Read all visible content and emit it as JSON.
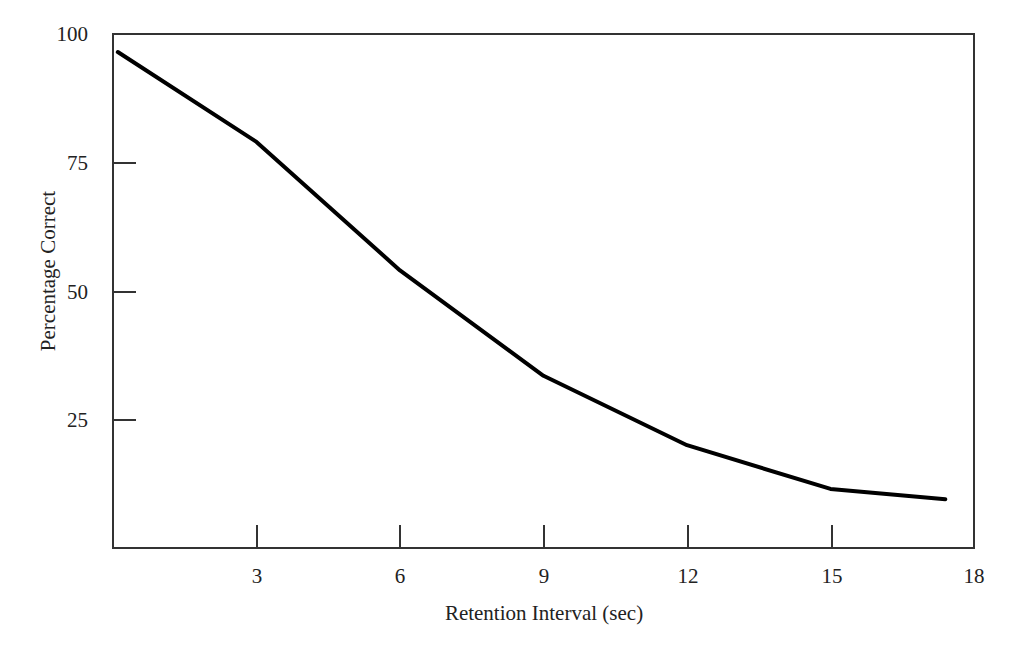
{
  "chart_data": {
    "type": "line",
    "title": "",
    "subtitle": "",
    "xlabel": "Retention Interval (sec)",
    "ylabel": "Percentage Correct",
    "xlim": [
      0,
      18
    ],
    "ylim": [
      0,
      100
    ],
    "xticks": [
      3,
      6,
      9,
      12,
      15,
      18
    ],
    "xtick_labels": [
      "3",
      "6",
      "9",
      "12",
      "15",
      "18"
    ],
    "yticks": [
      25,
      50,
      75,
      100
    ],
    "ytick_labels": [
      "25",
      "50",
      "75",
      "100"
    ],
    "grid": false,
    "legend": null,
    "series": [
      {
        "name": "Percentage Correct",
        "color": "#000000",
        "line_width": 4,
        "markers": false,
        "x": [
          0.1,
          3,
          6,
          9,
          12,
          15,
          17.4
        ],
        "y": [
          96.5,
          79,
          54,
          33.5,
          20,
          11.5,
          9.5
        ]
      }
    ],
    "annotations": []
  },
  "axes": {
    "frame_color": "#333333",
    "tick_direction": "in",
    "y_axis_title": "Percentage Correct",
    "x_axis_title": "Retention Interval (sec)"
  }
}
